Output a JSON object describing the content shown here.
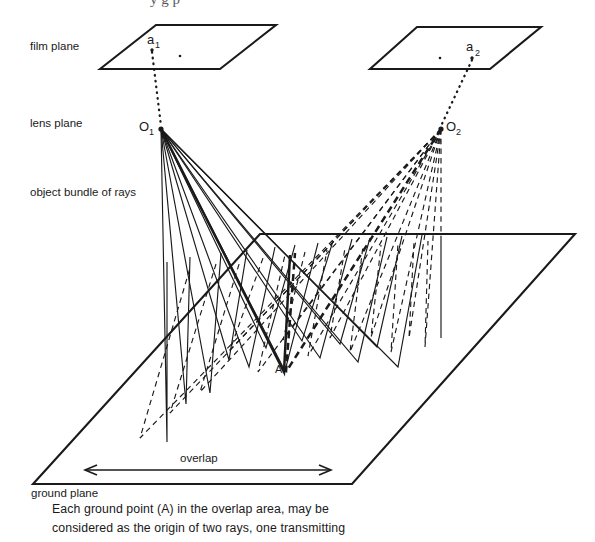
{
  "figure": {
    "top_cropped_text": "y  g   p",
    "labels": {
      "film_plane": "film plane",
      "lens_plane": "lens plane",
      "object_bundle": "object bundle of rays",
      "ground_plane": "ground plane",
      "overlap": "overlap"
    },
    "points": {
      "a1_base": "a",
      "a1_sub": "1",
      "a2_base": "a",
      "a2_sub": "2",
      "o1_base": "O",
      "o1_sub": "1",
      "o2_base": "O",
      "o2_sub": "2",
      "ground_point": "A"
    },
    "caption": {
      "line1": "Each ground point (A) in the overlap area, may be",
      "line2": "considered as the origin of two rays, one transmitting"
    },
    "colors": {
      "ink": "#1a1a1a",
      "paper": "#ffffff"
    }
  }
}
